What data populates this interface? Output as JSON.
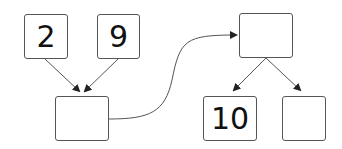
{
  "diagram": {
    "type": "number-bond-flow",
    "colors": {
      "stroke": "#555555",
      "text": "#111111",
      "background": "#ffffff"
    },
    "nodes": [
      {
        "id": "input-a",
        "label": "2"
      },
      {
        "id": "input-b",
        "label": "9"
      },
      {
        "id": "sum",
        "label": ""
      },
      {
        "id": "whole",
        "label": ""
      },
      {
        "id": "part-a",
        "label": "10"
      },
      {
        "id": "part-b",
        "label": ""
      }
    ],
    "edges": [
      {
        "from": "input-a",
        "to": "sum"
      },
      {
        "from": "input-b",
        "to": "sum"
      },
      {
        "from": "sum",
        "to": "whole",
        "style": "curved"
      },
      {
        "from": "whole",
        "to": "part-a"
      },
      {
        "from": "whole",
        "to": "part-b"
      }
    ]
  }
}
